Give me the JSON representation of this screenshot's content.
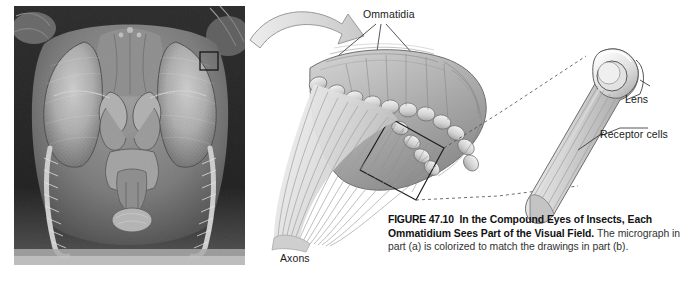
{
  "figure": {
    "number_label": "FIGURE 47.10",
    "title": "In the Compound Eyes of Insects, Each Ommatidium Sees Part of the Visual Field.",
    "body": "The micrograph in part (a) is colorized to match the drawings in part (b)."
  },
  "labels": {
    "ommatidia": "Ommatidia",
    "lens": "Lens",
    "receptor_cells": "Receptor cells",
    "axons": "Axons"
  },
  "panels": {
    "micrograph": {
      "name": "scanning electron micrograph of insect head",
      "subject": "fly head with two large compound eyes",
      "callout_box": "small square outline on right compound eye"
    },
    "diagram": {
      "name": "cutaway drawing of compound eye",
      "parts": [
        "array of ommatidia forming the eye surface",
        "boxed group of ommatidia",
        "bundle of axons leaving the eye",
        "enlarged single ommatidium"
      ]
    }
  },
  "colors": {
    "background": "#ffffff",
    "ink": "#1a1a1a",
    "caption_body": "#333333",
    "diagram_light": "#e8e8e8",
    "diagram_mid": "#c2c2c2",
    "diagram_dark": "#8f8f8f",
    "outline": "#555555"
  }
}
